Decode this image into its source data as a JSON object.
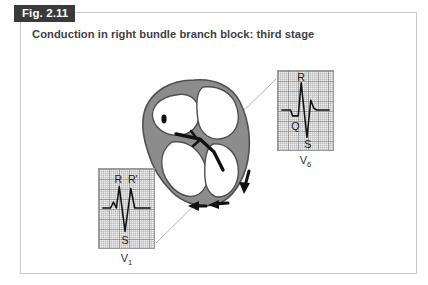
{
  "figure": {
    "tab_label": "Fig. 2.11",
    "title": "Conduction in right bundle branch block: third stage",
    "frame_color": "#c9c9c9",
    "tab_bg_color": "#3a3a3a",
    "title_color": "#3f3f3f"
  },
  "heart_diagram": {
    "name": "heart-cross-section",
    "wall_color": "#8c8c8c",
    "wall_outline_color": "#4f4f4f",
    "chamber_color": "#ffffff",
    "conduction_color": "#111111",
    "sa_node_marker": "sa-node-dot",
    "arrows": [
      {
        "name": "arrow-right-ventricle-down",
        "direction": "down"
      },
      {
        "name": "arrow-apex-left-1",
        "direction": "left"
      },
      {
        "name": "arrow-apex-left-2",
        "direction": "left"
      }
    ],
    "leader_line_color": "#b3b3b3"
  },
  "ecg_panels": [
    {
      "id": "v6",
      "lead_label": "V",
      "lead_subscript": "6",
      "grid_bg": "#f0f0f0",
      "trace_color": "#111111",
      "wave_labels": [
        {
          "text": "R",
          "name": "wave-label-r"
        },
        {
          "text": "Q",
          "name": "wave-label-q"
        },
        {
          "text": "S",
          "name": "wave-label-s"
        }
      ]
    },
    {
      "id": "v1",
      "lead_label": "V",
      "lead_subscript": "1",
      "grid_bg": "#f0f0f0",
      "trace_color": "#111111",
      "wave_labels": [
        {
          "text": "R",
          "name": "wave-label-r"
        },
        {
          "text": "R'",
          "name": "wave-label-r-prime"
        },
        {
          "text": "S",
          "name": "wave-label-s"
        }
      ]
    }
  ]
}
